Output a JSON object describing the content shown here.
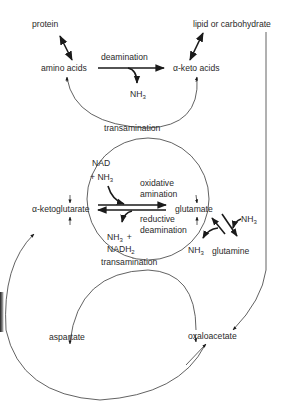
{
  "diagram": {
    "nodes": {
      "protein": "protein",
      "lipid": "lipid or carbohydrate",
      "amino_acids": "amino acids",
      "keto_acids": "α-keto acids",
      "ketoglutarate": "α-ketoglutarate",
      "glutamate": "glutamate",
      "glutamine": "glutamine",
      "aspartate": "aspartate",
      "oxaloacetate": "oxaloacetate"
    },
    "processes": {
      "deamination": "deamination",
      "transamination_top": "transamination",
      "oxidative": "oxidative",
      "amination": "amination",
      "reductive": "reductive",
      "reductive_deamination": "deamination",
      "transamination_bottom": "transamination"
    },
    "cofactors": {
      "nh3_deam": "NH",
      "nh3_deam_sub": "3",
      "nad": "NAD",
      "plus_nh3": "+ NH",
      "plus_nh3_sub": "3",
      "nh3_plus": "NH",
      "nh3_plus_sub": "3",
      "plus": "+",
      "nadh2": "NADH",
      "nadh2_sub": "2",
      "nh3_glutamine_in": "NH",
      "nh3_glutamine_in_sub": "3",
      "nh3_glutamine_out": "NH",
      "nh3_glutamine_out_sub": "3"
    }
  }
}
